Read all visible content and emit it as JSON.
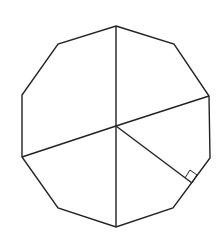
{
  "figure": {
    "title": "",
    "shape": "regular decagon",
    "stroke_color": "#222222",
    "background": "#ffffff",
    "center": [
      116,
      126
    ],
    "vertices": [
      [
        116,
        26
      ],
      [
        174,
        44
      ],
      [
        209,
        96
      ],
      [
        210,
        158
      ],
      [
        173,
        208
      ],
      [
        116,
        227
      ],
      [
        58,
        208
      ],
      [
        22,
        157
      ],
      [
        22,
        95
      ],
      [
        58,
        44
      ]
    ],
    "segments_from_center": [
      {
        "name": "radius-to-top-vertex",
        "to": [
          116,
          26
        ]
      },
      {
        "name": "radius-to-bottom-vertex",
        "to": [
          116,
          227
        ]
      },
      {
        "name": "radius-to-right-vertex",
        "to": [
          209,
          96
        ]
      },
      {
        "name": "radius-to-left-vertex",
        "to": [
          22,
          157
        ]
      },
      {
        "name": "apothem",
        "to": [
          192,
          183
        ]
      }
    ],
    "right_angle_marker": [
      [
        185,
        178
      ],
      [
        190,
        170
      ],
      [
        197,
        175
      ],
      [
        192,
        183
      ]
    ]
  }
}
